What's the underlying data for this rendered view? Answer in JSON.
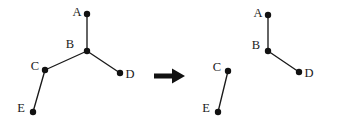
{
  "figure": {
    "background_color": "#ffffff",
    "ink_color": "#111111",
    "width": 337,
    "height": 127,
    "transition": {
      "symbol": "⟹",
      "name": "implies-double-arrow",
      "x": 154,
      "y": 76,
      "length": 31,
      "shaft_thickness": 5,
      "head_width": 13,
      "head_height": 15
    },
    "graphs": [
      {
        "id": "before",
        "name": "left-graph",
        "nodes": [
          {
            "id": "A",
            "label": "A",
            "x": 87,
            "y": 14,
            "label_x": 77,
            "label_y": 13
          },
          {
            "id": "B",
            "label": "B",
            "x": 87,
            "y": 51,
            "label_x": 70,
            "label_y": 45
          },
          {
            "id": "C",
            "label": "C",
            "x": 45,
            "y": 70,
            "label_x": 35,
            "label_y": 67
          },
          {
            "id": "D",
            "label": "D",
            "x": 120,
            "y": 73,
            "label_x": 130,
            "label_y": 75
          },
          {
            "id": "E",
            "label": "E",
            "x": 33,
            "y": 112,
            "label_x": 21,
            "label_y": 109
          }
        ],
        "edges": [
          {
            "from": "A",
            "to": "B"
          },
          {
            "from": "B",
            "to": "C"
          },
          {
            "from": "B",
            "to": "D"
          },
          {
            "from": "C",
            "to": "E"
          }
        ]
      },
      {
        "id": "after",
        "name": "right-graph",
        "nodes": [
          {
            "id": "A",
            "label": "A",
            "x": 268,
            "y": 15,
            "label_x": 258,
            "label_y": 14
          },
          {
            "id": "B",
            "label": "B",
            "x": 268,
            "y": 51,
            "label_x": 256,
            "label_y": 46
          },
          {
            "id": "C",
            "label": "C",
            "x": 228,
            "y": 71,
            "label_x": 217,
            "label_y": 68
          },
          {
            "id": "D",
            "label": "D",
            "x": 299,
            "y": 72,
            "label_x": 309,
            "label_y": 74
          },
          {
            "id": "E",
            "label": "E",
            "x": 218,
            "y": 112,
            "label_x": 206,
            "label_y": 109
          }
        ],
        "edges": [
          {
            "from": "A",
            "to": "B"
          },
          {
            "from": "B",
            "to": "D"
          },
          {
            "from": "C",
            "to": "E"
          }
        ]
      }
    ],
    "node_radius": 3.2
  }
}
